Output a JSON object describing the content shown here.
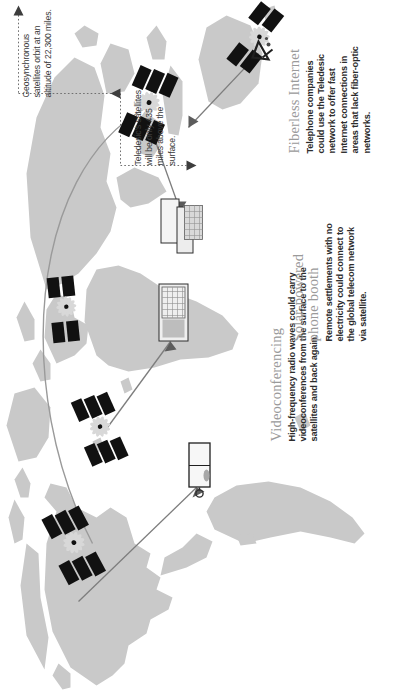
{
  "figure": {
    "orientation": "rotated-90-ccw",
    "background_color": "#ffffff",
    "landmass_color": "#c9c9c9",
    "title_color": "#9a9a9a",
    "body_text_color": "#2c2c2c",
    "line_color": "#8a8a8a"
  },
  "callouts": [
    {
      "id": "videoconferencing",
      "title": "Videoconferencing",
      "body": "High-frequency radio waves could carry videoconferences from the surface to the satellites and back again."
    },
    {
      "id": "fiberless-internet",
      "title": "Fiberless Internet",
      "body": "Telephone companies could use the Teledesic network to offer fast Internet connections in areas that lack fiber-optic networks."
    },
    {
      "id": "solar-powered-phone-booth",
      "title": "Solar-powered\nphone booth",
      "body": "Remote settlements with no electricity could connect to the global telecom network via satellite."
    }
  ],
  "notes": [
    {
      "id": "geosynchronous-orbit",
      "text": "Geosynchronous satellites orbit at an altitude of 22,300 miles."
    },
    {
      "id": "teledesic-orbit",
      "text": "Teledesic's satellites will be only 435 miles above the surface."
    }
  ],
  "measurements": {
    "geosynchronous_altitude": "22,300 miles",
    "teledesic_altitude": "435 miles"
  },
  "satellites": [
    {
      "id": "satellite-1",
      "label": "satellite"
    },
    {
      "id": "satellite-2",
      "label": "satellite"
    },
    {
      "id": "satellite-3",
      "label": "satellite"
    },
    {
      "id": "satellite-4",
      "label": "satellite"
    },
    {
      "id": "satellite-5",
      "label": "satellite"
    }
  ],
  "ground_stations": [
    {
      "id": "ground-station-videoconference",
      "label": "videoconference terminal"
    },
    {
      "id": "ground-station-internet",
      "label": "internet ground terminal"
    },
    {
      "id": "phone-booth",
      "label": "solar-powered phone booth"
    },
    {
      "id": "dish-antenna",
      "label": "ground dish antenna"
    }
  ]
}
